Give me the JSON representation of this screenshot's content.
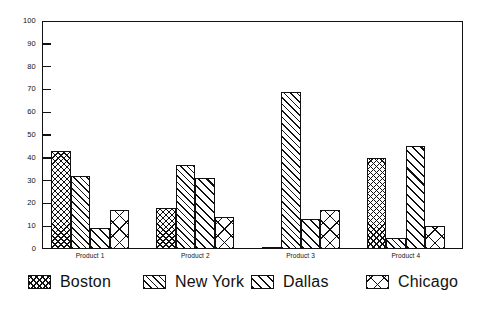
{
  "chart_data": {
    "type": "bar",
    "title": "",
    "xlabel": "",
    "ylabel": "",
    "ylim": [
      0,
      100
    ],
    "yticks": [
      0,
      10,
      20,
      30,
      40,
      50,
      60,
      70,
      80,
      90,
      100
    ],
    "grid": false,
    "legend_position": "bottom",
    "categories": [
      "Product 1",
      "Product 2",
      "Product 3",
      "Product 4"
    ],
    "series": [
      {
        "name": "Boston",
        "pattern": "dense-crosshatch",
        "values": [
          43,
          18,
          1,
          40
        ]
      },
      {
        "name": "New York",
        "pattern": "diagonal-hatch",
        "values": [
          32,
          37,
          69,
          5
        ]
      },
      {
        "name": "Dallas",
        "pattern": "wide-diagonal-hatch",
        "values": [
          9,
          31,
          13,
          45
        ]
      },
      {
        "name": "Chicago",
        "pattern": "large-x-crosshatch",
        "values": [
          17,
          14,
          17,
          10
        ]
      }
    ]
  },
  "colors": {
    "ink": "#111111",
    "background": "#ffffff"
  },
  "legend": {
    "items": [
      {
        "label": "Boston"
      },
      {
        "label": "New York"
      },
      {
        "label": "Dallas"
      },
      {
        "label": "Chicago"
      }
    ]
  }
}
